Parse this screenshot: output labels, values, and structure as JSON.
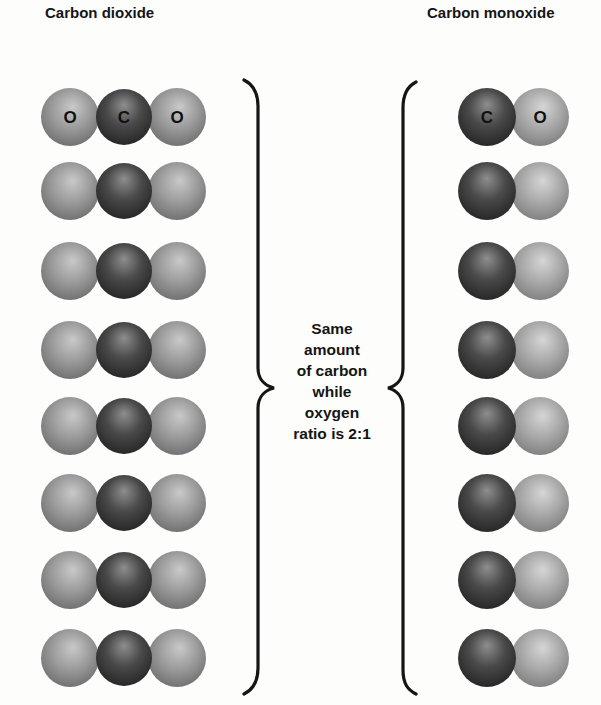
{
  "titles": {
    "left": "Carbon dioxide",
    "right": "Carbon monoxide"
  },
  "center_text": {
    "lines": [
      "Same",
      "amount",
      "of carbon",
      "while",
      "oxygen",
      "ratio is  2:1"
    ]
  },
  "co2": {
    "first_row_labels": [
      "O",
      "C",
      "O"
    ],
    "rows": 8,
    "row_centers_y": [
      117,
      191,
      271,
      350,
      426,
      503,
      580,
      658
    ],
    "atom_x": [
      70,
      124,
      177
    ],
    "radius": 29
  },
  "co": {
    "first_row_labels": [
      "C",
      "O"
    ],
    "rows": 8,
    "row_centers_y": [
      117,
      191,
      271,
      350,
      426,
      503,
      580,
      658
    ],
    "atom_x": [
      487,
      540
    ],
    "radius": 29
  },
  "colors": {
    "oxygen": "#8a8a8a",
    "oxygen_light": "#c4c4c4",
    "carbon": "#3a3a3a",
    "carbon_light": "#8c8c8c",
    "ink": "#151515"
  }
}
